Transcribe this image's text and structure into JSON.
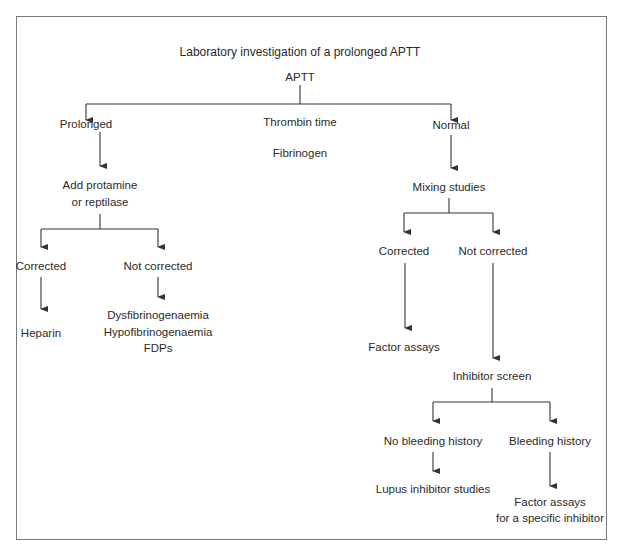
{
  "diagram": {
    "title": "Laboratory investigation of a prolonged APTT",
    "root": "APTT",
    "nodes": {
      "prolonged": "Prolonged",
      "thrombin_time": "Thrombin time",
      "fibrinogen": "Fibrinogen",
      "normal": "Normal",
      "add_protamine_1": "Add protamine",
      "add_protamine_2": "or reptilase",
      "left_corrected": "Corrected",
      "left_not_corrected": "Not corrected",
      "heparin": "Heparin",
      "dysfib": "Dysfibrinogenaemia",
      "hypofib": "Hypofibrinogenaemia",
      "fdps": "FDPs",
      "mixing_studies": "Mixing studies",
      "right_corrected": "Corrected",
      "right_not_corrected": "Not corrected",
      "factor_assays": "Factor assays",
      "inhibitor_screen": "Inhibitor screen",
      "no_bleeding": "No bleeding history",
      "bleeding": "Bleeding history",
      "lupus": "Lupus inhibitor studies",
      "factor_specific_1": "Factor assays",
      "factor_specific_2": "for a specific inhibitor"
    },
    "colors": {
      "line": "#333333",
      "border": "#7a7a7a",
      "text": "#2a2a2a"
    }
  }
}
